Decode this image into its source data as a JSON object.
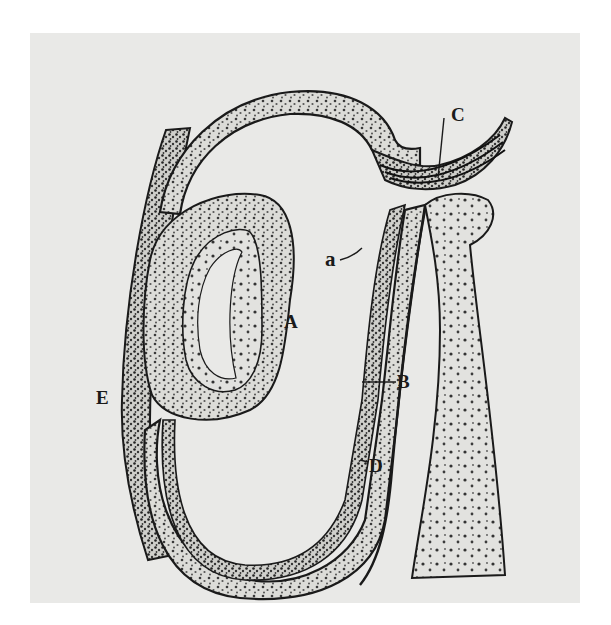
{
  "figure": {
    "type": "anatomical illustration",
    "background": "#e9e9e7",
    "ink": "#1a1a1a",
    "labels": [
      {
        "id": "A",
        "text": "A",
        "x": 284,
        "y": 321
      },
      {
        "id": "B",
        "text": "B",
        "x": 397,
        "y": 372
      },
      {
        "id": "C",
        "text": "C",
        "x": 451,
        "y": 105
      },
      {
        "id": "D",
        "text": "D",
        "x": 369,
        "y": 457
      },
      {
        "id": "E",
        "text": "E",
        "x": 96,
        "y": 388
      },
      {
        "id": "a",
        "text": "a",
        "x": 325,
        "y": 253
      }
    ]
  }
}
